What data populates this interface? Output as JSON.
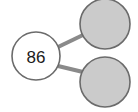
{
  "diagram": {
    "type": "node-link-graph",
    "background_color": "#ffffff",
    "canvas": {
      "width": 138,
      "height": 112
    },
    "styles": {
      "root_fill": "#ffffff",
      "leaf_fill": "#cbcbcb",
      "node_stroke": "#6b6b6b",
      "node_stroke_width": 1.6,
      "edge_color": "#8a8a8a",
      "edge_width": 4,
      "label_color": "#1a1a1a",
      "label_font_size": 17
    },
    "nodes": [
      {
        "id": "root",
        "label": "86",
        "name": "node-86",
        "role": "root",
        "fill": "#ffffff",
        "cx": 36,
        "cy": 56,
        "r": 24
      },
      {
        "id": "leaf-top",
        "label": "",
        "name": "node-leaf-top",
        "role": "leaf",
        "fill": "#cbcbcb",
        "cx": 105,
        "cy": 24,
        "r": 25
      },
      {
        "id": "leaf-bottom",
        "label": "",
        "name": "node-leaf-bottom",
        "role": "leaf",
        "fill": "#cbcbcb",
        "cx": 105,
        "cy": 82,
        "r": 25
      }
    ],
    "edges": [
      {
        "id": "edge-root-top",
        "name": "edge-86-to-leaf-top",
        "from": "root",
        "to": "leaf-top",
        "x1": 58,
        "y1": 47,
        "x2": 83,
        "y2": 35
      },
      {
        "id": "edge-root-bottom",
        "name": "edge-86-to-leaf-bottom",
        "from": "root",
        "to": "leaf-bottom",
        "x1": 58,
        "y1": 66,
        "x2": 83,
        "y2": 72
      }
    ]
  }
}
